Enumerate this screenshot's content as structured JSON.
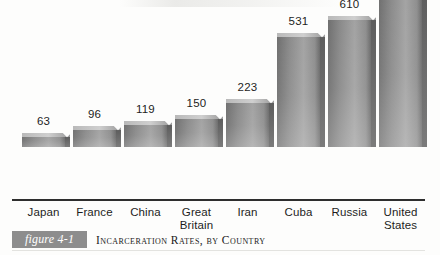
{
  "figure": {
    "tag": "figure 4-1",
    "caption": "Incarceration Rates, by Country",
    "tag_background": "#8d8d8d",
    "tag_text_color": "#ffffff"
  },
  "chart_data": {
    "type": "bar",
    "title": "Incarceration Rates, by Country",
    "xlabel": "",
    "ylabel": "",
    "categories": [
      "Japan",
      "France",
      "China",
      "Great Britain",
      "Iran",
      "Cuba",
      "Russia",
      "United States"
    ],
    "values": [
      63,
      96,
      119,
      150,
      223,
      531,
      610,
      753
    ],
    "value_labels": [
      "63",
      "96",
      "119",
      "150",
      "223",
      "531",
      "610",
      "753"
    ],
    "category_lines": [
      [
        "Japan"
      ],
      [
        "France"
      ],
      [
        "China"
      ],
      [
        "Great",
        "Britain"
      ],
      [
        "Iran"
      ],
      [
        "Cuba"
      ],
      [
        "Russia"
      ],
      [
        "United",
        "States"
      ]
    ],
    "ylim": [
      0,
      753
    ],
    "grid": false,
    "legend": null,
    "bar_color": "#8a8a8a",
    "bar_shadow_color": "#5d5d5d",
    "bar_highlight_color": "#c4c4c4",
    "axis_color": "#2e2e2e",
    "background": "#fdfdfc",
    "style": "3d-extruded-bars",
    "units": "prisoners per 100,000 population"
  },
  "layout": {
    "axis_left": 12,
    "axis_right": 425,
    "baseline_y": 199,
    "max_bar_height": 162,
    "bar_width": 43,
    "bar_depth": 5,
    "slot_starts": [
      22,
      73,
      124,
      175,
      226,
      277,
      328,
      379
    ]
  }
}
